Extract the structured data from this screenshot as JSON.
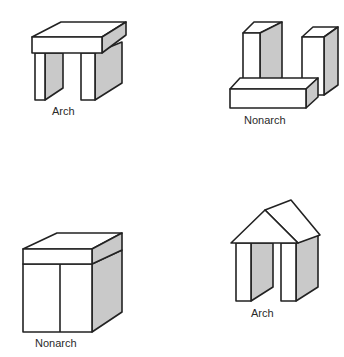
{
  "figures": [
    {
      "id": "arch-1",
      "label": "Arch",
      "structure": "two-posts-with-flat-lintel"
    },
    {
      "id": "nonarch-1",
      "label": "Nonarch",
      "structure": "two-posts-with-lintel-fallen-in-front"
    },
    {
      "id": "nonarch-2",
      "label": "Nonarch",
      "structure": "posts-touching-with-lintel"
    },
    {
      "id": "arch-2",
      "label": "Arch",
      "structure": "two-posts-with-wedge-roof"
    }
  ],
  "colors": {
    "stroke": "#222222",
    "shading": "#c9c9c9",
    "background": "#ffffff"
  }
}
